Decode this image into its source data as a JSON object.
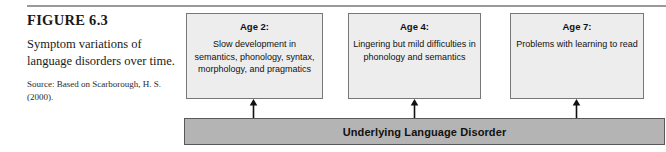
{
  "figure": {
    "label": "FIGURE 6.3",
    "caption": "Symptom variations of language disorders over time.",
    "source": "Source: Based on Scarborough, H. S. (2000)."
  },
  "diagram": {
    "type": "flow-diagram",
    "base_bar": {
      "label": "Underlying Language Disorder",
      "fill_color": "#b4b4b4",
      "border_color": "#585858"
    },
    "box_fill_color": "#ededed",
    "box_border_color": "#777777",
    "arrow_color": "#111111",
    "arrow_direction": "up",
    "boxes": [
      {
        "title": "Age 2:",
        "body": "Slow development in semantics, phonology, syntax, morphology, and pragmatics"
      },
      {
        "title": "Age 4:",
        "body": "Lingering but mild difficulties in phonology and semantics"
      },
      {
        "title": "Age 7:",
        "body": "Problems with learning to read"
      }
    ]
  }
}
